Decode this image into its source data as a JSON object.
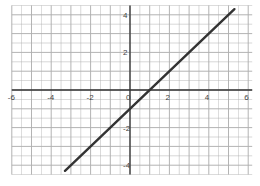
{
  "chart_data": {
    "type": "line",
    "title": "",
    "xlabel": "",
    "ylabel": "",
    "xlim": [
      -6,
      6
    ],
    "ylim": [
      -4,
      4
    ],
    "grid": true,
    "grid_step": 0.5,
    "x_ticks": [
      -6,
      -4,
      -2,
      0,
      2,
      4,
      6
    ],
    "y_ticks": [
      4,
      2,
      -2,
      -4
    ],
    "x_tick_labels": [
      "-6",
      "-4",
      "-2",
      "0",
      "2",
      "4",
      "6"
    ],
    "y_tick_labels": [
      "4",
      "2",
      "-2",
      "-4"
    ],
    "series": [
      {
        "name": "y = x - 1",
        "equation": "y = x - 1",
        "slope": 1,
        "intercept": -1,
        "x": [
          -3.3,
          5.3
        ],
        "y": [
          -4.3,
          4.3
        ]
      }
    ]
  },
  "colors": {
    "grid": "#b0b0b0",
    "axis": "#333333",
    "line": "#333333",
    "background": "#ffffff"
  }
}
